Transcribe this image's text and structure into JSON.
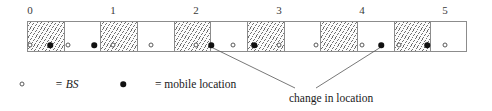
{
  "diagram": {
    "column_labels": [
      "0",
      "1",
      "2",
      "3",
      "4",
      "5"
    ],
    "column_label_x": [
      30,
      113,
      196,
      279,
      362,
      445
    ],
    "strip": {
      "x": 27,
      "y": 21,
      "width": 440,
      "height": 31,
      "cell_count": 12,
      "cell_width": 36.6,
      "pattern": [
        "hatched",
        "blank",
        "hatched",
        "blank",
        "hatched",
        "blank",
        "hatched",
        "blank",
        "hatched",
        "blank",
        "hatched",
        "blank"
      ]
    },
    "base_stations": {
      "symbol": "open-circle",
      "label": "BS",
      "x_positions": [
        30,
        68,
        113,
        151,
        196,
        233,
        279,
        316,
        362,
        399,
        445
      ]
    },
    "mobile_locations": {
      "symbol": "filled-circle",
      "label": "mobile location",
      "x_positions": [
        50,
        94,
        211,
        254,
        381,
        427
      ]
    },
    "annotation": {
      "text": "change in location",
      "x": 289,
      "y": 92,
      "leaders": [
        {
          "from_x": 211,
          "from_y": 47,
          "to_x": 295,
          "to_y": 88
        },
        {
          "from_x": 381,
          "from_y": 47,
          "to_x": 316,
          "to_y": 88
        }
      ]
    },
    "legend": {
      "entries": [
        {
          "symbol": "open-circle",
          "sym_x": 22,
          "text": "= BS",
          "text_x": 55,
          "italic": true
        },
        {
          "symbol": "filled-circle",
          "sym_x": 123,
          "text": "= mobile location",
          "text_x": 155,
          "italic": false
        }
      ]
    },
    "colors": {
      "ink": "#1a1a1a",
      "line": "#8c8c8c",
      "hatch": "#6f6f6f",
      "marker_fill": "#111111",
      "background": "#ffffff"
    }
  }
}
